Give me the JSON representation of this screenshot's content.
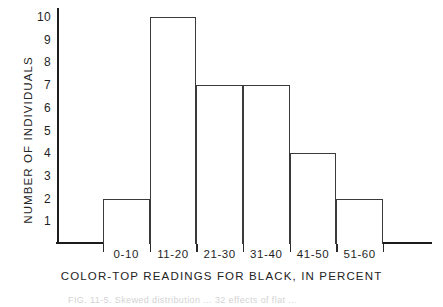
{
  "chart_data": {
    "type": "bar",
    "title": "",
    "subtitle": "",
    "categories": [
      "0-10",
      "11-20",
      "21-30",
      "31-40",
      "41-50",
      "51-60"
    ],
    "values": [
      2,
      10,
      7,
      7,
      4,
      2
    ],
    "series": [
      {
        "name": "Number of individuals",
        "values": [
          2,
          10,
          7,
          7,
          4,
          2
        ]
      }
    ],
    "xlabel": "COLOR-TOP READINGS FOR BLACK, IN PERCENT",
    "ylabel": "NUMBER OF INDIVIDUALS",
    "ylim": [
      0,
      10.4
    ],
    "yticks": [
      1,
      2,
      3,
      4,
      5,
      6,
      7,
      8,
      9,
      10
    ],
    "ytick_labels": [
      "1",
      "2",
      "3",
      "4",
      "5",
      "6",
      "7",
      "8",
      "9",
      "10"
    ],
    "grid": false,
    "legend": false,
    "legend_position": "none",
    "bar_style": "outline",
    "bar_gap": 0,
    "annotations": [],
    "axis_color": "#1c1c1c",
    "bar_edge_color": "#3a3a3a",
    "bar_fill_color": "#ffffff",
    "background_color": "#ffffff"
  },
  "caption": {
    "text": "FIG. 11-5.  Skewed distribution ... 32 effects of flat ..."
  }
}
